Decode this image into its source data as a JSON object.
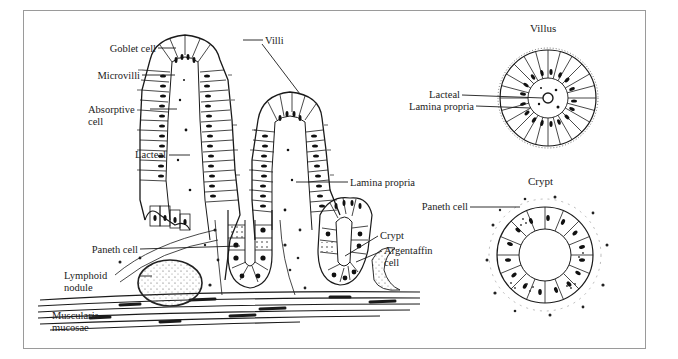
{
  "figure": {
    "panels": [
      {
        "id": "longitudinal",
        "description": "Longitudinal section of intestinal mucosa"
      },
      {
        "id": "villus-cross",
        "title": "Villus"
      },
      {
        "id": "crypt-cross",
        "title": "Crypt"
      }
    ],
    "longitudinal": {
      "labels": {
        "goblet_cell": "Goblet cell",
        "villi": "Villi",
        "microvilli": "Microvilli",
        "absorptive_cell_1": "Absorptive",
        "absorptive_cell_2": "cell",
        "lacteal": "Lacteal",
        "lamina_propria": "Lamina propria",
        "paneth_cell": "Paneth cell",
        "crypt": "Crypt",
        "argentaffin_cell_1": "Argentaffin",
        "argentaffin_cell_2": "cell",
        "lymphoid_nodule_1": "Lymphoid",
        "lymphoid_nodule_2": "nodule",
        "muscularis_mucosae_1": "Muscularis",
        "muscularis_mucosae_2": "mucosae"
      }
    },
    "villus_cross": {
      "title": "Villus",
      "labels": {
        "lacteal": "Lacteal",
        "lamina_propria": "Lamina propria"
      }
    },
    "crypt_cross": {
      "title": "Crypt",
      "labels": {
        "paneth_cell": "Paneth cell"
      }
    },
    "colors": {
      "ink": "#1a1a1a",
      "border": "#9a9a9a",
      "background": "#ffffff"
    }
  }
}
